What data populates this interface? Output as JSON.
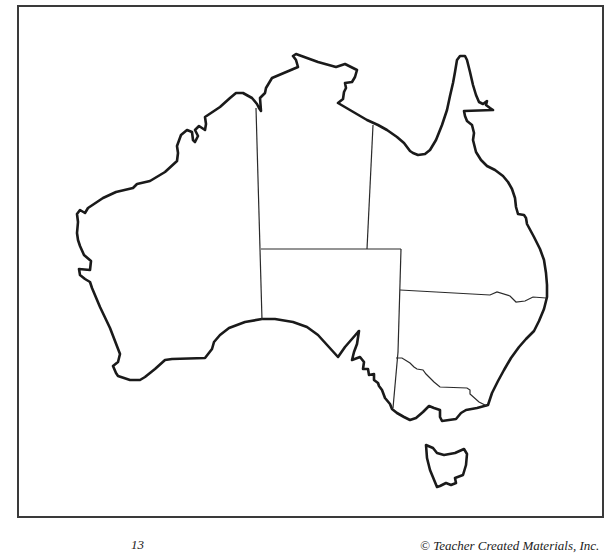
{
  "map": {
    "subject": "Outline map of Australia",
    "regions": [
      {
        "id": "western-australia",
        "label": ""
      },
      {
        "id": "northern-territory",
        "label": ""
      },
      {
        "id": "south-australia",
        "label": ""
      },
      {
        "id": "queensland",
        "label": ""
      },
      {
        "id": "new-south-wales",
        "label": ""
      },
      {
        "id": "victoria",
        "label": ""
      },
      {
        "id": "tasmania",
        "label": ""
      }
    ],
    "colors": {
      "coastline": "#1a1a1a",
      "border": "#2a2a2a",
      "frame": "#3a3a3a",
      "background": "#ffffff"
    }
  },
  "footer": {
    "page_number": "13",
    "copyright": "© Teacher Created Materials, Inc."
  }
}
